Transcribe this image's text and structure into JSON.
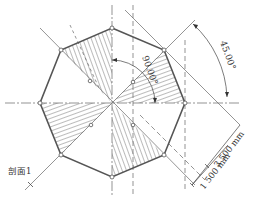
{
  "diagram": {
    "type": "octagonal section layout (plan view)",
    "colors": {
      "outline": "#555555",
      "axis": "#666666",
      "hatch": "#555555",
      "text": "#333333",
      "background": "#ffffff"
    },
    "labels": {
      "section_label": "剖面1",
      "angle_90": "90.00°",
      "angle_45": "45.00°",
      "dim_3500": "3 500 mm",
      "dim_1500": "1 500 mm"
    },
    "shape": {
      "kind": "regular octagon",
      "vertex_count": 8,
      "hatched_sectors": 4
    }
  }
}
